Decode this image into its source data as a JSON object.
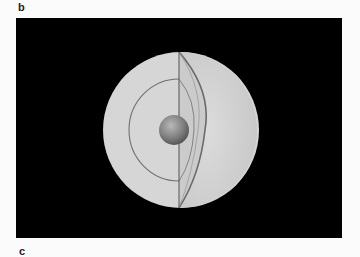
{
  "figure": {
    "panel_label_top": "b",
    "panel_label_bottom": "c",
    "colors": {
      "background": "#000000",
      "sphere_fill": "#d4d4d4",
      "sphere_right": "#cfcfcf",
      "layer_line": "#6e6e6e",
      "core": "#8a8a8a"
    }
  }
}
